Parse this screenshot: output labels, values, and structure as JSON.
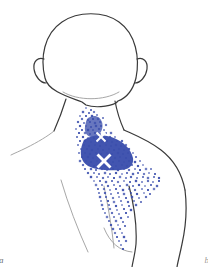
{
  "figure": {
    "caption_left": "a",
    "caption_right": "b",
    "subject_view": "posterior upper body",
    "body_region": "head, neck, shoulder and upper back"
  },
  "colors": {
    "background": "#ffffff",
    "outline": "#3a3a3a",
    "outline_faint": "#8c8c8c",
    "pain_dot": "#3b4fad",
    "pain_core": "#3b4fad",
    "marker": "#ffffff",
    "label": "#6b6b6b"
  },
  "markers": [
    {
      "id": "trigger-point-upper",
      "label": "X",
      "x": 101,
      "y": 137,
      "size": 9
    },
    {
      "id": "trigger-point-lower",
      "label": "X",
      "x": 104,
      "y": 161,
      "size": 13
    }
  ],
  "pain_pattern": {
    "name": "referred-pain-stipple",
    "density": "dense core with diffuse spray",
    "core_bounds": {
      "x": 82,
      "y": 138,
      "width": 50,
      "height": 32
    }
  },
  "chart_data": {
    "type": "scatter",
    "xlabel": "",
    "ylabel": "",
    "grid": false,
    "legend": "none",
    "xlim": [
      0,
      208
    ],
    "ylim": [
      0,
      267
    ],
    "series": [
      {
        "name": "referred-pain-stipple",
        "color": "#3b4fad",
        "points": [
          [
            86,
            108
          ],
          [
            91,
            110
          ],
          [
            83,
            112
          ],
          [
            89,
            113
          ],
          [
            94,
            112
          ],
          [
            80,
            116
          ],
          [
            86,
            116
          ],
          [
            92,
            116
          ],
          [
            97,
            115
          ],
          [
            82,
            119
          ],
          [
            88,
            120
          ],
          [
            93,
            119
          ],
          [
            98,
            119
          ],
          [
            103,
            118
          ],
          [
            78,
            122
          ],
          [
            84,
            123
          ],
          [
            90,
            122
          ],
          [
            95,
            123
          ],
          [
            100,
            122
          ],
          [
            80,
            126
          ],
          [
            86,
            126
          ],
          [
            91,
            127
          ],
          [
            96,
            126
          ],
          [
            101,
            126
          ],
          [
            106,
            125
          ],
          [
            76,
            129
          ],
          [
            82,
            130
          ],
          [
            88,
            130
          ],
          [
            93,
            130
          ],
          [
            99,
            129
          ],
          [
            104,
            130
          ],
          [
            79,
            133
          ],
          [
            85,
            133
          ],
          [
            90,
            134
          ],
          [
            95,
            133
          ],
          [
            100,
            134
          ],
          [
            106,
            133
          ],
          [
            111,
            133
          ],
          [
            77,
            137
          ],
          [
            83,
            137
          ],
          [
            88,
            138
          ],
          [
            94,
            138
          ],
          [
            99,
            137
          ],
          [
            105,
            138
          ],
          [
            110,
            137
          ],
          [
            115,
            137
          ],
          [
            80,
            141
          ],
          [
            85,
            141
          ],
          [
            91,
            142
          ],
          [
            96,
            141
          ],
          [
            102,
            142
          ],
          [
            107,
            141
          ],
          [
            112,
            142
          ],
          [
            117,
            141
          ],
          [
            122,
            141
          ],
          [
            78,
            145
          ],
          [
            84,
            145
          ],
          [
            89,
            146
          ],
          [
            95,
            145
          ],
          [
            100,
            146
          ],
          [
            106,
            145
          ],
          [
            111,
            146
          ],
          [
            116,
            145
          ],
          [
            121,
            146
          ],
          [
            126,
            145
          ],
          [
            81,
            149
          ],
          [
            87,
            149
          ],
          [
            92,
            150
          ],
          [
            98,
            149
          ],
          [
            103,
            150
          ],
          [
            109,
            149
          ],
          [
            114,
            150
          ],
          [
            119,
            149
          ],
          [
            124,
            150
          ],
          [
            129,
            149
          ],
          [
            79,
            153
          ],
          [
            85,
            153
          ],
          [
            90,
            154
          ],
          [
            96,
            153
          ],
          [
            101,
            154
          ],
          [
            107,
            153
          ],
          [
            112,
            154
          ],
          [
            118,
            153
          ],
          [
            123,
            154
          ],
          [
            128,
            153
          ],
          [
            133,
            153
          ],
          [
            82,
            157
          ],
          [
            88,
            157
          ],
          [
            93,
            158
          ],
          [
            99,
            157
          ],
          [
            104,
            158
          ],
          [
            110,
            157
          ],
          [
            115,
            158
          ],
          [
            120,
            157
          ],
          [
            126,
            158
          ],
          [
            131,
            157
          ],
          [
            136,
            157
          ],
          [
            80,
            161
          ],
          [
            86,
            161
          ],
          [
            91,
            162
          ],
          [
            97,
            161
          ],
          [
            102,
            162
          ],
          [
            108,
            161
          ],
          [
            113,
            162
          ],
          [
            119,
            161
          ],
          [
            124,
            162
          ],
          [
            129,
            161
          ],
          [
            135,
            162
          ],
          [
            140,
            161
          ],
          [
            83,
            165
          ],
          [
            89,
            165
          ],
          [
            94,
            166
          ],
          [
            100,
            165
          ],
          [
            105,
            166
          ],
          [
            111,
            165
          ],
          [
            116,
            166
          ],
          [
            122,
            165
          ],
          [
            127,
            166
          ],
          [
            132,
            165
          ],
          [
            138,
            166
          ],
          [
            143,
            165
          ],
          [
            85,
            169
          ],
          [
            91,
            169
          ],
          [
            96,
            170
          ],
          [
            102,
            169
          ],
          [
            107,
            170
          ],
          [
            113,
            169
          ],
          [
            118,
            170
          ],
          [
            124,
            169
          ],
          [
            129,
            170
          ],
          [
            135,
            169
          ],
          [
            140,
            170
          ],
          [
            146,
            169
          ],
          [
            151,
            169
          ],
          [
            88,
            173
          ],
          [
            94,
            173
          ],
          [
            99,
            174
          ],
          [
            105,
            173
          ],
          [
            110,
            174
          ],
          [
            116,
            173
          ],
          [
            122,
            174
          ],
          [
            127,
            173
          ],
          [
            133,
            174
          ],
          [
            138,
            173
          ],
          [
            144,
            174
          ],
          [
            149,
            173
          ],
          [
            155,
            174
          ],
          [
            91,
            177
          ],
          [
            97,
            177
          ],
          [
            103,
            178
          ],
          [
            108,
            177
          ],
          [
            114,
            178
          ],
          [
            120,
            177
          ],
          [
            126,
            178
          ],
          [
            131,
            177
          ],
          [
            137,
            178
          ],
          [
            143,
            177
          ],
          [
            148,
            178
          ],
          [
            154,
            177
          ],
          [
            159,
            178
          ],
          [
            94,
            181
          ],
          [
            100,
            181
          ],
          [
            106,
            182
          ],
          [
            112,
            181
          ],
          [
            118,
            182
          ],
          [
            124,
            181
          ],
          [
            130,
            182
          ],
          [
            136,
            181
          ],
          [
            142,
            182
          ],
          [
            148,
            181
          ],
          [
            153,
            182
          ],
          [
            159,
            181
          ],
          [
            96,
            185
          ],
          [
            102,
            185
          ],
          [
            108,
            186
          ],
          [
            114,
            185
          ],
          [
            120,
            186
          ],
          [
            127,
            185
          ],
          [
            133,
            186
          ],
          [
            139,
            185
          ],
          [
            145,
            186
          ],
          [
            151,
            185
          ],
          [
            157,
            186
          ],
          [
            98,
            189
          ],
          [
            104,
            189
          ],
          [
            110,
            190
          ],
          [
            116,
            189
          ],
          [
            123,
            190
          ],
          [
            129,
            189
          ],
          [
            135,
            190
          ],
          [
            142,
            189
          ],
          [
            148,
            190
          ],
          [
            154,
            189
          ],
          [
            99,
            193
          ],
          [
            105,
            193
          ],
          [
            111,
            194
          ],
          [
            118,
            193
          ],
          [
            124,
            194
          ],
          [
            131,
            193
          ],
          [
            137,
            194
          ],
          [
            144,
            193
          ],
          [
            150,
            194
          ],
          [
            100,
            197
          ],
          [
            106,
            197
          ],
          [
            113,
            198
          ],
          [
            119,
            197
          ],
          [
            126,
            198
          ],
          [
            132,
            197
          ],
          [
            139,
            198
          ],
          [
            146,
            197
          ],
          [
            101,
            201
          ],
          [
            108,
            201
          ],
          [
            114,
            202
          ],
          [
            121,
            201
          ],
          [
            128,
            202
          ],
          [
            134,
            201
          ],
          [
            141,
            202
          ],
          [
            102,
            205
          ],
          [
            109,
            205
          ],
          [
            116,
            206
          ],
          [
            122,
            205
          ],
          [
            129,
            206
          ],
          [
            136,
            205
          ],
          [
            103,
            209
          ],
          [
            110,
            209
          ],
          [
            117,
            210
          ],
          [
            124,
            209
          ],
          [
            131,
            210
          ],
          [
            105,
            213
          ],
          [
            112,
            213
          ],
          [
            119,
            214
          ],
          [
            126,
            213
          ],
          [
            107,
            217
          ],
          [
            114,
            217
          ],
          [
            121,
            218
          ],
          [
            128,
            217
          ],
          [
            109,
            221
          ],
          [
            116,
            221
          ],
          [
            123,
            222
          ],
          [
            111,
            225
          ],
          [
            118,
            225
          ],
          [
            125,
            226
          ],
          [
            113,
            229
          ],
          [
            120,
            229
          ],
          [
            115,
            233
          ],
          [
            122,
            233
          ],
          [
            117,
            237
          ],
          [
            124,
            237
          ],
          [
            119,
            241
          ],
          [
            126,
            241
          ],
          [
            121,
            245
          ],
          [
            123,
            249
          ]
        ]
      }
    ]
  }
}
